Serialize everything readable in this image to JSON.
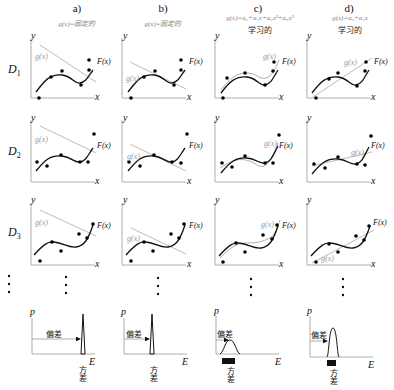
{
  "columns": [
    {
      "label": "a)",
      "subtitle": "g(x)=固定的",
      "subtitle2": ""
    },
    {
      "label": "b)",
      "subtitle": "g(x)=固定的",
      "subtitle2": ""
    },
    {
      "label": "c)",
      "subtitle": "g(x)=a₀+a₁x+a₂x²+a₃x³",
      "subtitle2": "学习的"
    },
    {
      "label": "d)",
      "subtitle": "g(x)=a₀+a₁x",
      "subtitle2": "学习的"
    }
  ],
  "rows": [
    {
      "label": "D",
      "sub": "1"
    },
    {
      "label": "D",
      "sub": "2"
    },
    {
      "label": "D",
      "sub": "3"
    }
  ],
  "axis": {
    "y": "y",
    "x": "x",
    "p": "p",
    "E": "E"
  },
  "curves": {
    "g": "g(x)",
    "F": "F(x)"
  },
  "bottom": {
    "bias": "偏差",
    "variance": "方差"
  },
  "colors": {
    "true_curve": "#111111",
    "model_curve": "#999999",
    "points": "#111111"
  }
}
